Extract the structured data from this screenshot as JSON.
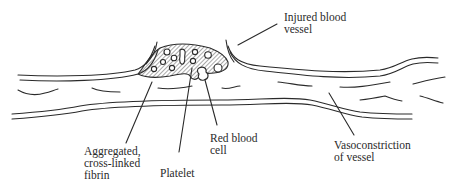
{
  "diagram": {
    "type": "anatomical illustration",
    "colors": {
      "line": "#2a2a2a",
      "background": "#ffffff"
    },
    "labels": {
      "injured_vessel": [
        "Injured blood",
        "vessel"
      ],
      "fibrin": [
        "Aggregated,",
        "cross-linked",
        "fibrin"
      ],
      "platelet": [
        "Platelet"
      ],
      "red_cell": [
        "Red blood",
        "cell"
      ],
      "vasoconstriction": [
        "Vasoconstriction",
        "of vessel"
      ]
    }
  }
}
